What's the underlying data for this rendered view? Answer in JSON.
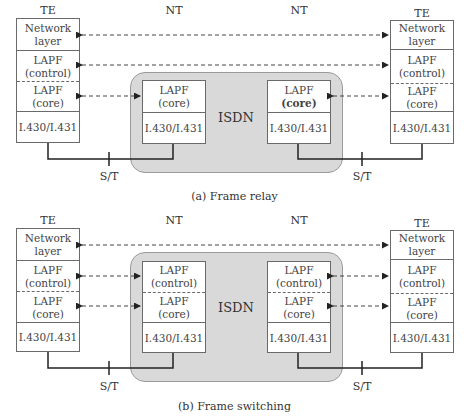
{
  "diagrams": [
    {
      "caption": "(a) Frame relay",
      "labels": {
        "te_left": "TE",
        "nt_left": "NT",
        "nt_right": "NT",
        "te_right": "TE",
        "isdn": "ISDN",
        "st_left": "S/T",
        "st_right": "S/T"
      },
      "te_left_layers": [
        {
          "line1": "Network",
          "line2": "layer"
        },
        {
          "line1": "LAPF",
          "line2": "(control)"
        },
        {
          "line1": "LAPF",
          "line2": "(core)"
        },
        {
          "line1": "I.430/I.431",
          "line2": ""
        }
      ],
      "nt_left_layers": [
        {
          "line1": "LAPF",
          "line2": "(core)"
        },
        {
          "line1": "I.430/I.431",
          "line2": ""
        }
      ],
      "nt_right_layers": [
        {
          "line1": "LAPF",
          "line2": "(core)"
        },
        {
          "line1": "I.430/I.431",
          "line2": ""
        }
      ],
      "te_right_layers": [
        {
          "line1": "Network",
          "line2": "layer"
        },
        {
          "line1": "LAPF",
          "line2": "(control)"
        },
        {
          "line1": "LAPF",
          "line2": "(core)"
        },
        {
          "line1": "I.430/I.431",
          "line2": ""
        }
      ]
    },
    {
      "caption": "(b) Frame switching",
      "labels": {
        "te_left": "TE",
        "nt_left": "NT",
        "nt_right": "NT",
        "te_right": "TE",
        "isdn": "ISDN",
        "st_left": "S/T",
        "st_right": "S/T"
      },
      "te_left_layers": [
        {
          "line1": "Network",
          "line2": "layer"
        },
        {
          "line1": "LAPF",
          "line2": "(control)"
        },
        {
          "line1": "LAPF",
          "line2": "(core)"
        },
        {
          "line1": "I.430/I.431",
          "line2": ""
        }
      ],
      "nt_left_layers": [
        {
          "line1": "LAPF",
          "line2": "(control)"
        },
        {
          "line1": "LAPF",
          "line2": "(core)"
        },
        {
          "line1": "I.430/I.431",
          "line2": ""
        }
      ],
      "nt_right_layers": [
        {
          "line1": "LAPF",
          "line2": "(control)"
        },
        {
          "line1": "LAPF",
          "line2": "(core)"
        },
        {
          "line1": "I.430/I.431",
          "line2": ""
        }
      ],
      "te_right_layers": [
        {
          "line1": "Network",
          "line2": "layer"
        },
        {
          "line1": "LAPF",
          "line2": "(control)"
        },
        {
          "line1": "LAPF",
          "line2": "(core)"
        },
        {
          "line1": "I.430/I.431",
          "line2": ""
        }
      ]
    }
  ]
}
